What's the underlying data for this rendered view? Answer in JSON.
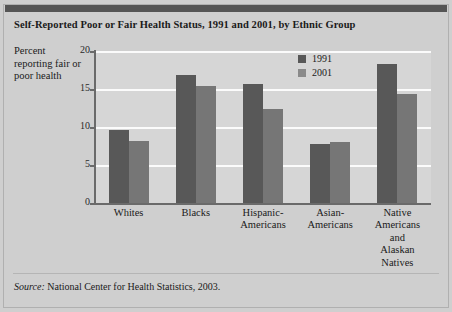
{
  "title": "Self-Reported Poor or Fair Health Status, 1991 and 2001, by Ethnic Group",
  "axis_label_text": "Percent reporting fair or poor health",
  "source": {
    "prefix": "Source:",
    "text": "National Center for Health Statistics, 2003."
  },
  "chart_data": {
    "type": "bar",
    "title": "Self-Reported Poor or Fair Health Status, 1991 and 2001, by Ethnic Group",
    "xlabel": "",
    "ylabel": "Percent reporting fair or poor health",
    "ylim": [
      0,
      20
    ],
    "yticks": [
      0,
      5,
      10,
      15,
      20
    ],
    "grid": true,
    "legend_position": "top-right",
    "categories": [
      "Whites",
      "Blacks",
      "Hispanic-Americans",
      "Asian-Americans",
      "Native Americans and Alaskan Natives"
    ],
    "category_lines": [
      [
        "Whites"
      ],
      [
        "Blacks"
      ],
      [
        "Hispanic-",
        "Americans"
      ],
      [
        "Asian-",
        "Americans"
      ],
      [
        "Native",
        "Americans",
        "and",
        "Alaskan",
        "Natives"
      ]
    ],
    "series": [
      {
        "name": "1991",
        "color": "#585858",
        "values": [
          9.6,
          16.8,
          15.6,
          7.7,
          18.3
        ]
      },
      {
        "name": "2001",
        "color": "#767676",
        "values": [
          8.2,
          15.4,
          12.4,
          8.0,
          14.4
        ]
      }
    ]
  },
  "colors": {
    "page_background": "#cfcfcf",
    "plot_background": "#d6d6d6",
    "gridline": "#fbfbfb",
    "axis": "#6a6a6a",
    "series_1991": "#585858",
    "series_2001": "#767676"
  }
}
